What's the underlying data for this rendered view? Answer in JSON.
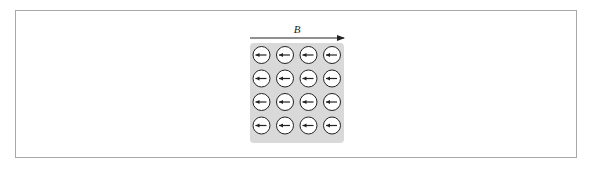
{
  "figure": {
    "field_label": "B",
    "field_direction": "right",
    "grid": {
      "rows": 4,
      "cols": 4,
      "spin_direction": "left"
    },
    "colors": {
      "frame_border": "#a8a8a8",
      "grid_background": "#d9d9d9",
      "circle_fill": "#ffffff",
      "stroke": "#222222"
    },
    "spins": [
      [
        "left",
        "left",
        "left",
        "left"
      ],
      [
        "left",
        "left",
        "left",
        "left"
      ],
      [
        "left",
        "left",
        "left",
        "left"
      ],
      [
        "left",
        "left",
        "left",
        "left"
      ]
    ]
  }
}
